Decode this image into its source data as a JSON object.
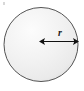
{
  "figure": {
    "background_color": "#ffffff",
    "canvas": {
      "width": 84,
      "height": 91
    },
    "shape": {
      "name": "circle",
      "center_x": 41,
      "center_y": 44.5,
      "radius": 37.5,
      "outline_color": "#545454",
      "outline_width": 1,
      "fill_light": "#fbfbfb",
      "fill_mid": "#f0f0f0",
      "fill_dark": "#e2e2e2",
      "highlight_x": 28,
      "highlight_y": 27
    },
    "arrow": {
      "name": "radius-arrow",
      "label": "r",
      "label_x": 60,
      "label_y": 36,
      "start_x": 39,
      "end_x": 78,
      "y": 41.5,
      "color": "#111111",
      "stroke_width": 1,
      "double_headed": true,
      "head_length": 6,
      "head_half_width": 3.6
    },
    "speck": {
      "name": "scan-speck",
      "color": "#d8d8d8"
    }
  }
}
